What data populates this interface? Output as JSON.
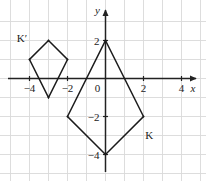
{
  "figure": {
    "kind": "coordinate-plane-graph",
    "background": "#ffffff",
    "grid_color": "#d9d9d9",
    "axis_color": "#222222",
    "shape_color": "#1a1a1a"
  },
  "axes": {
    "x_label": "x",
    "y_label": "y",
    "origin_label": "0",
    "x_ticks": [
      {
        "value": -4,
        "label": "−4"
      },
      {
        "value": -2,
        "label": "−2"
      },
      {
        "value": 2,
        "label": "2"
      },
      {
        "value": 4,
        "label": "4"
      }
    ],
    "y_ticks": [
      {
        "value": 2,
        "label": "2"
      },
      {
        "value": -2,
        "label": "−2"
      },
      {
        "value": -4,
        "label": "−4"
      }
    ],
    "xlim": [
      -5,
      5
    ],
    "ylim": [
      -5,
      3
    ],
    "grid": true,
    "grid_step": 1
  },
  "chart_data": {
    "type": "scatter",
    "title": "",
    "xlabel": "x",
    "ylabel": "y",
    "xlim": [
      -5,
      5
    ],
    "ylim": [
      -5,
      3
    ],
    "grid": true,
    "legend": "none",
    "series": [
      {
        "name": "K",
        "shape": "kite-polygon",
        "label": "K",
        "label_position": [
          2.3,
          -3.2
        ],
        "closed": true,
        "points": [
          [
            0,
            2
          ],
          [
            2,
            -2
          ],
          [
            0,
            -4
          ],
          [
            -2,
            -2
          ]
        ]
      },
      {
        "name": "K'",
        "shape": "kite-polygon",
        "label": "K′",
        "label_position": [
          -4.4,
          1.9
        ],
        "closed": true,
        "points": [
          [
            -3,
            2
          ],
          [
            -2,
            1
          ],
          [
            -3,
            -1
          ],
          [
            -4,
            1
          ]
        ]
      }
    ]
  }
}
